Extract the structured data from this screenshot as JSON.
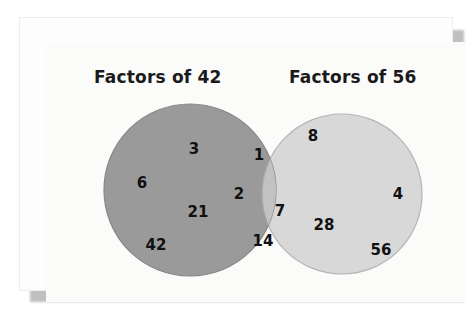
{
  "diagram": {
    "type": "venn-2-set",
    "title_left": "Factors of 42",
    "title_right": "Factors of 56",
    "colors": {
      "left_circle_fill": "#9a9a9a",
      "right_circle_fill": "#d8d8d8",
      "intersection_fill": "#c2c2c2",
      "circle_stroke": "#8a8a8a",
      "canvas_background": "#fbfbfa",
      "frame_background": "#fdfdfd",
      "shadow": "#c0c0c0",
      "text": "#111111"
    },
    "sets": {
      "left_only": {
        "name": "Factors of 42 only",
        "values": [
          {
            "label": "3",
            "x": 148,
            "y": 107
          },
          {
            "label": "6",
            "x": 96,
            "y": 141
          },
          {
            "label": "21",
            "x": 152,
            "y": 170
          },
          {
            "label": "42",
            "x": 110,
            "y": 203
          }
        ]
      },
      "intersection": {
        "name": "Common factors of 42 and 56",
        "values": [
          {
            "label": "1",
            "x": 213,
            "y": 113
          },
          {
            "label": "2",
            "x": 193,
            "y": 152
          },
          {
            "label": "7",
            "x": 234,
            "y": 169
          },
          {
            "label": "14",
            "x": 217,
            "y": 199
          }
        ]
      },
      "right_only": {
        "name": "Factors of 56 only",
        "values": [
          {
            "label": "8",
            "x": 267,
            "y": 94
          },
          {
            "label": "4",
            "x": 352,
            "y": 152
          },
          {
            "label": "28",
            "x": 278,
            "y": 183
          },
          {
            "label": "56",
            "x": 335,
            "y": 208
          }
        ]
      }
    },
    "geometry": {
      "left_circle": {
        "cx": 144,
        "cy": 148,
        "r": 86
      },
      "right_circle": {
        "cx": 296,
        "cy": 152,
        "r": 80
      }
    }
  }
}
